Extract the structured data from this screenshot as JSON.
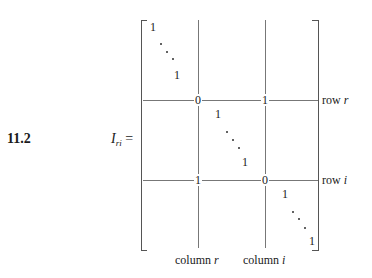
{
  "equation": {
    "number": "11.2",
    "lhs_symbol": "I",
    "lhs_subscript": "ri",
    "equals": "="
  },
  "matrix": {
    "top_block": {
      "first": "1",
      "last": "1"
    },
    "row_r": {
      "col_r_entry": "0",
      "col_i_entry": "1",
      "label_prefix": "row",
      "label_var": "r"
    },
    "middle_block": {
      "first": "1",
      "last": "1"
    },
    "row_i": {
      "col_r_entry": "1",
      "col_i_entry": "0",
      "label_prefix": "row",
      "label_var": "i"
    },
    "bottom_block": {
      "first": "1",
      "last": "1"
    },
    "column_labels": [
      {
        "prefix": "column",
        "var": "r"
      },
      {
        "prefix": "column",
        "var": "i"
      }
    ]
  }
}
